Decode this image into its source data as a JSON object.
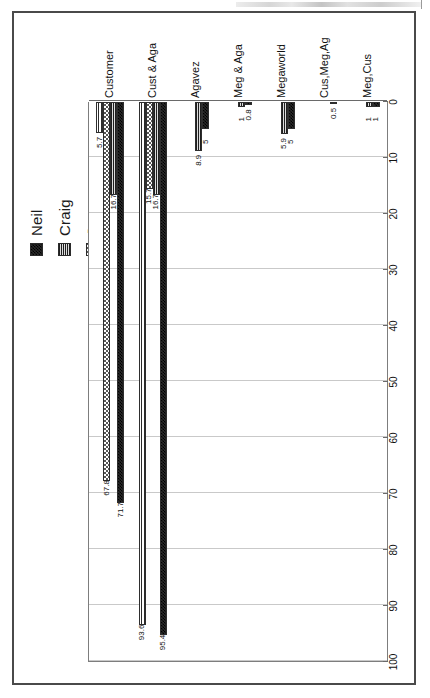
{
  "page": {
    "background_color": "#ffffff",
    "frame_color": "#4a4a4a"
  },
  "chart_data": {
    "type": "bar",
    "orientation": "horizontal",
    "title": "",
    "subtitle": "",
    "xlabel": "",
    "ylabel": "",
    "xlim": [
      0,
      100
    ],
    "xticks": [
      0,
      10,
      20,
      30,
      40,
      50,
      60,
      70,
      80,
      90,
      100
    ],
    "xtick_labels": [
      "0",
      "10",
      "20",
      "30",
      "40",
      "50",
      "60",
      "70",
      "80",
      "90",
      "100"
    ],
    "grid": true,
    "grid_axis": "x",
    "legend_position": "top-right",
    "categories": [
      "Customer",
      "Cust & Aga",
      "Agavez",
      "Meg & Aga",
      "Megaworld",
      "Cus,Meg,Ag",
      "Meg,Cus"
    ],
    "series": [
      {
        "name": "Neil",
        "pattern": "dense-checkerboard",
        "color": "#2a2a2a",
        "values": [
          71.7,
          95.4,
          5,
          0.8,
          5,
          0.5,
          1
        ],
        "labels": [
          "71.7",
          "95.4",
          "5",
          "0.8",
          "5",
          "0.5",
          "1"
        ]
      },
      {
        "name": "Craig",
        "pattern": "horizontal-hatch",
        "color": "#8e8e8e",
        "values": [
          16.7,
          16.7,
          8.9,
          1,
          5.9,
          null,
          1
        ],
        "labels": [
          "16.7",
          "16.7",
          "8.9",
          "1",
          "5.9",
          "",
          "1"
        ]
      },
      {
        "name": "Jesse",
        "pattern": "speckled-dots",
        "color": "#585858",
        "values": [
          67.8,
          15.7,
          null,
          null,
          null,
          null,
          null
        ],
        "labels": [
          "67.8",
          "15.7",
          "",
          "",
          "",
          "",
          ""
        ]
      },
      {
        "name": "Jason",
        "pattern": "light-stripes",
        "color": "#ffffff",
        "values": [
          5.7,
          93.6,
          null,
          null,
          null,
          null,
          null
        ],
        "labels": [
          "5.7",
          "93.6",
          "",
          "",
          "",
          "",
          ""
        ]
      }
    ]
  },
  "legend": {
    "entries": [
      {
        "label": "Neil"
      },
      {
        "label": "Craig"
      },
      {
        "label": "Jesse"
      },
      {
        "label": "Jason"
      }
    ]
  }
}
